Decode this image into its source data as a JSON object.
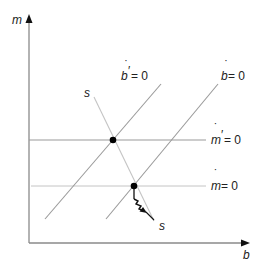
{
  "diagram": {
    "axes": {
      "y_label": "m",
      "x_label": "b"
    },
    "curves": {
      "b_prime_dot": {
        "var": "b",
        "prime": "′",
        "eq": " = 0",
        "label": "ḃ′ = 0"
      },
      "b_dot": {
        "var": "b",
        "eq": " = 0",
        "label": "ḃ = 0"
      },
      "m_prime_dot": {
        "var": "m",
        "prime": "′",
        "eq": " = 0",
        "label": "ṁ′ = 0"
      },
      "m_dot": {
        "var": "m",
        "eq": " = 0",
        "label": "ṁ = 0"
      },
      "saddle_path": {
        "label_top": "s",
        "label_bottom": "s"
      }
    },
    "points": [
      {
        "name": "initial-equilibrium",
        "x": 134,
        "y": 186
      },
      {
        "name": "new-equilibrium",
        "x": 113,
        "y": 140
      }
    ],
    "colors": {
      "axis": "#8a8a8a",
      "line": "#9a9a9a",
      "light_line": "#c4c4c4",
      "point": "#000000",
      "text": "#222222"
    }
  }
}
